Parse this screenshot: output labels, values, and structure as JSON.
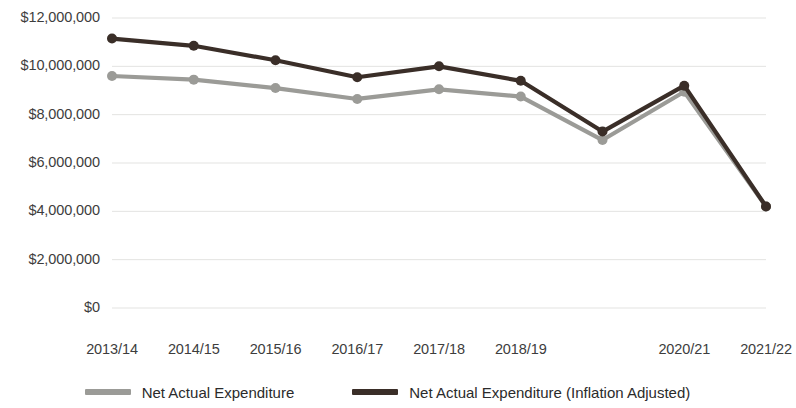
{
  "chart_data": {
    "type": "line",
    "title": "",
    "xlabel": "",
    "ylabel": "",
    "categories": [
      "2013/14",
      "2014/15",
      "2015/16",
      "2016/17",
      "2017/18",
      "2018/19",
      "2019/20",
      "2020/21",
      "2021/22"
    ],
    "tick_labels_shown": [
      "2013/14",
      "2014/15",
      "2015/16",
      "2016/17",
      "2017/18",
      "2018/19",
      "2020/21",
      "2021/22"
    ],
    "ylim": [
      0,
      12000000
    ],
    "yticks": [
      0,
      2000000,
      4000000,
      6000000,
      8000000,
      10000000,
      12000000
    ],
    "ytick_labels": [
      "$0",
      "$2,000,000",
      "$4,000,000",
      "$6,000,000",
      "$8,000,000",
      "$10,000,000",
      "$12,000,000"
    ],
    "grid": true,
    "legend_position": "bottom",
    "series": [
      {
        "name": "Net Actual Expenditure",
        "color": "#9b9b97",
        "values": [
          9600000,
          9450000,
          9100000,
          8650000,
          9050000,
          8750000,
          6950000,
          8950000,
          4200000
        ]
      },
      {
        "name": "Net Actual Expenditure (Inflation Adjusted)",
        "color": "#3a2e28",
        "values": [
          11150000,
          10850000,
          10250000,
          9550000,
          10000000,
          9400000,
          7300000,
          9200000,
          4200000
        ]
      }
    ]
  },
  "legend": {
    "items": [
      {
        "label": "Net Actual Expenditure",
        "color": "#9b9b97"
      },
      {
        "label": "Net Actual Expenditure (Inflation Adjusted)",
        "color": "#3a2e28"
      }
    ]
  }
}
